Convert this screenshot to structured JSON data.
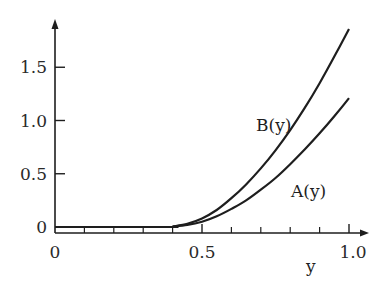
{
  "chart_data": {
    "type": "line",
    "title": "",
    "xlabel": "y",
    "ylabel": "",
    "xlim": [
      0,
      1.0
    ],
    "ylim": [
      0,
      1.85
    ],
    "grid": false,
    "legend": "inline labels",
    "x_ticks": [
      0,
      0.5,
      1.0
    ],
    "x_tick_labels": [
      "0",
      "0.5",
      "1.0"
    ],
    "x_minor_ticks": [
      0.1,
      0.2,
      0.3,
      0.4,
      0.6,
      0.7,
      0.8,
      0.9
    ],
    "y_ticks": [
      0,
      0.5,
      1.0,
      1.5
    ],
    "y_tick_labels": [
      "0",
      "0.5",
      "1.0",
      "1.5"
    ],
    "series": [
      {
        "name": "B(y)",
        "x": [
          0,
          0.1,
          0.2,
          0.3,
          0.4,
          0.45,
          0.5,
          0.55,
          0.6,
          0.65,
          0.7,
          0.75,
          0.8,
          0.85,
          0.9,
          0.95,
          1.0
        ],
        "values": [
          0,
          0,
          0,
          0,
          0.005,
          0.03,
          0.08,
          0.16,
          0.27,
          0.4,
          0.55,
          0.72,
          0.91,
          1.12,
          1.35,
          1.6,
          1.86
        ]
      },
      {
        "name": "A(y)",
        "x": [
          0,
          0.1,
          0.2,
          0.3,
          0.4,
          0.45,
          0.5,
          0.55,
          0.6,
          0.65,
          0.7,
          0.75,
          0.8,
          0.85,
          0.9,
          0.95,
          1.0
        ],
        "values": [
          0,
          0,
          0,
          0,
          0.004,
          0.02,
          0.05,
          0.1,
          0.17,
          0.25,
          0.35,
          0.46,
          0.59,
          0.73,
          0.88,
          1.04,
          1.21
        ]
      }
    ],
    "annotations": [
      {
        "text": "B(y)",
        "x": 0.72,
        "y": 0.95
      },
      {
        "text": "A(y)",
        "x": 0.8,
        "y": 0.55
      }
    ]
  }
}
